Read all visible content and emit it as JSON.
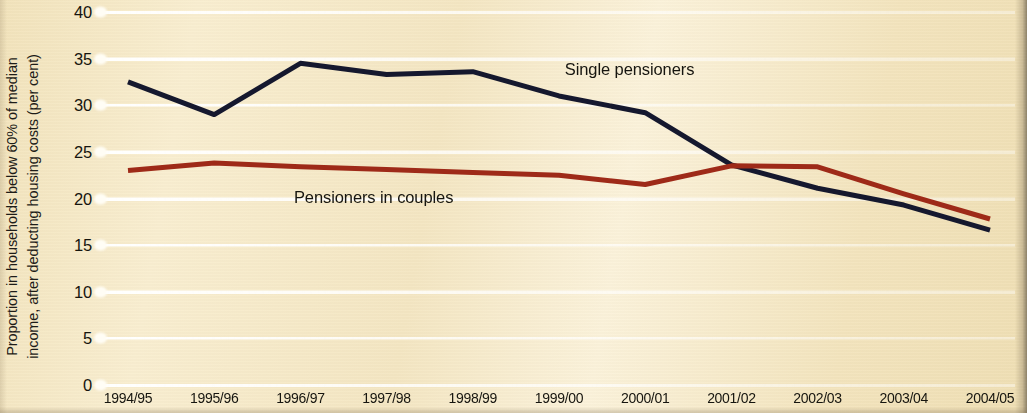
{
  "chart_data": {
    "type": "line",
    "title": "",
    "xlabel": "",
    "ylabel": "Proportion in households below 60% of median income, after deducting housing costs (per cent)",
    "ylabel_line1": "Proportion in households below 60% of median",
    "ylabel_line2": "income, after deducting housing costs (per cent)",
    "categories": [
      "1994/95",
      "1995/96",
      "1996/97",
      "1997/98",
      "1998/99",
      "1999/00",
      "2000/01",
      "2001/02",
      "2002/03",
      "2003/04",
      "2004/05"
    ],
    "yticks": [
      0,
      5,
      10,
      15,
      20,
      25,
      30,
      35,
      40
    ],
    "ylim": [
      0,
      40
    ],
    "grid": true,
    "legend_position": "inline-annotations",
    "series": [
      {
        "name": "Single pensioners",
        "color": "#15182e",
        "values": [
          32.5,
          29.0,
          34.5,
          33.3,
          33.6,
          31.0,
          29.2,
          23.6,
          21.1,
          19.3,
          16.6
        ]
      },
      {
        "name": "Pensioners in couples",
        "color": "#9e2a18",
        "values": [
          23.0,
          23.8,
          23.4,
          23.1,
          22.8,
          22.5,
          21.5,
          23.5,
          23.4,
          20.5,
          17.8
        ]
      }
    ],
    "annotations": [
      {
        "text": "Single pensioners",
        "x_frac": 0.508,
        "y_value": 33.8
      },
      {
        "text": "Pensioners in couples",
        "x_frac": 0.212,
        "y_value": 20.1
      }
    ]
  },
  "colors": {
    "background": "#f4e6c2",
    "gridline": "#ffffff",
    "text": "#16150f",
    "single_pensioners": "#15182e",
    "pensioners_in_couples": "#9e2a18"
  }
}
